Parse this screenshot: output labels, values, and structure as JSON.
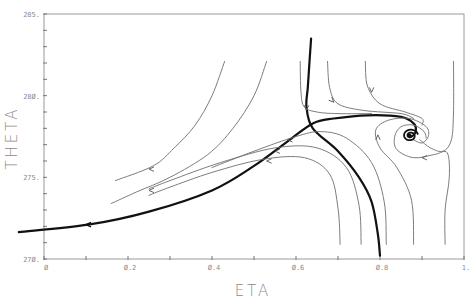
{
  "chart_data": {
    "type": "line",
    "title": "",
    "xlabel": "ETA",
    "ylabel": "THETA",
    "xlim": [
      0,
      1
    ],
    "ylim": [
      270,
      285
    ],
    "grid": false,
    "legend": null,
    "x_ticks": {
      "values": [
        0,
        0.2,
        0.4,
        0.6,
        0.8,
        1.0
      ],
      "labels": [
        "Ø",
        "Ø.2",
        "Ø.4",
        "Ø.6",
        "Ø.8",
        "1."
      ]
    },
    "y_ticks": {
      "values": [
        270,
        275,
        280,
        285
      ],
      "labels": [
        "27Ø.",
        "275.",
        "28Ø.",
        "285."
      ]
    },
    "minor_tick_step": {
      "x": 0.1,
      "y": 1
    },
    "annotations": [
      "phase-portrait trajectories with direction arrows",
      "saddle point near ETA≈0.64, THETA≈278.3",
      "stable spiral focus near ETA≈0.87, THETA≈277.5"
    ],
    "series": [
      {
        "name": "separatrix-stable-left",
        "style": "thick",
        "x": [
          -0.06,
          0.105,
          0.25,
          0.4,
          0.5,
          0.585,
          0.64,
          0.69,
          0.77,
          0.85,
          0.88,
          0.885,
          0.875,
          0.868,
          0.872
        ],
        "y": [
          271.65,
          272.1,
          272.9,
          274.2,
          275.7,
          277.3,
          278.3,
          278.6,
          278.8,
          278.7,
          278.3,
          277.8,
          277.5,
          277.6,
          277.6
        ],
        "arrows": [
          {
            "x": 0.1,
            "y": 272.1,
            "dir": "left"
          }
        ]
      },
      {
        "name": "separatrix-vertical",
        "style": "thick",
        "x": [
          0.636,
          0.632,
          0.628,
          0.625,
          0.64,
          0.7,
          0.75,
          0.78,
          0.795,
          0.8
        ],
        "y": [
          283.5,
          282,
          280.5,
          279.3,
          278.0,
          276.6,
          275.0,
          273.5,
          271.5,
          270.2
        ]
      },
      {
        "name": "traj-upper-left-1",
        "style": "thin",
        "x": [
          0.43,
          0.4,
          0.36,
          0.31,
          0.26,
          0.17
        ],
        "y": [
          282.1,
          280.0,
          278.2,
          276.8,
          275.7,
          274.8
        ],
        "arrows": [
          {
            "x": 0.25,
            "y": 275.5,
            "dir": "left"
          }
        ]
      },
      {
        "name": "traj-upper-left-2",
        "style": "thin",
        "x": [
          0.53,
          0.5,
          0.45,
          0.39,
          0.3,
          0.22,
          0.16
        ],
        "y": [
          282.1,
          280.0,
          278.0,
          276.4,
          275.0,
          274.1,
          273.4
        ],
        "arrows": [
          {
            "x": 0.25,
            "y": 274.2,
            "dir": "left"
          }
        ]
      },
      {
        "name": "traj-near-saddle-1",
        "style": "thin",
        "x": [
          0.61,
          0.612,
          0.62,
          0.65,
          0.7,
          0.78
        ],
        "y": [
          282.1,
          280.2,
          279.3,
          279.0,
          278.9,
          278.9
        ],
        "arrows": [
          {
            "x": 0.625,
            "y": 279.1,
            "dir": "down"
          }
        ]
      },
      {
        "name": "traj-near-saddle-2",
        "style": "thin",
        "x": [
          0.675,
          0.68,
          0.7,
          0.76,
          0.85,
          0.88
        ],
        "y": [
          282.1,
          280.5,
          279.5,
          279.1,
          278.9,
          278.6
        ],
        "arrows": [
          {
            "x": 0.69,
            "y": 279.6,
            "dir": "down-right"
          }
        ]
      },
      {
        "name": "traj-near-saddle-3",
        "style": "thin",
        "x": [
          0.765,
          0.77,
          0.8,
          0.86,
          0.9,
          0.9
        ],
        "y": [
          282.1,
          280.6,
          279.5,
          279.0,
          278.6,
          278.2
        ],
        "arrows": [
          {
            "x": 0.78,
            "y": 280.2,
            "dir": "down"
          }
        ]
      },
      {
        "name": "traj-lower-1",
        "style": "thin",
        "x": [
          0.705,
          0.7,
          0.68,
          0.62,
          0.52,
          0.4,
          0.3,
          0.25
        ],
        "y": [
          270.9,
          273.1,
          275.2,
          276.2,
          276.1,
          275.3,
          274.4,
          273.9
        ],
        "arrows": [
          {
            "x": 0.53,
            "y": 276.0,
            "dir": "left"
          }
        ]
      },
      {
        "name": "traj-lower-2",
        "style": "thin",
        "x": [
          0.755,
          0.75,
          0.72,
          0.65,
          0.55,
          0.42,
          0.3,
          0.25
        ],
        "y": [
          270.9,
          273.3,
          275.6,
          276.8,
          276.8,
          275.9,
          274.8,
          274.3
        ],
        "arrows": [
          {
            "x": 0.55,
            "y": 276.6,
            "dir": "left"
          }
        ]
      },
      {
        "name": "traj-lower-3",
        "style": "thin",
        "x": [
          0.815,
          0.81,
          0.78,
          0.72,
          0.66,
          0.6,
          0.5,
          0.4
        ],
        "y": [
          270.9,
          273.5,
          275.9,
          277.4,
          277.8,
          277.5,
          276.6,
          275.6
        ],
        "arrows": [
          {
            "x": 0.58,
            "y": 277.3,
            "dir": "left"
          }
        ]
      },
      {
        "name": "traj-lower-spiral-4",
        "style": "thin",
        "x": [
          0.88,
          0.875,
          0.84,
          0.8,
          0.79,
          0.82,
          0.87,
          0.91,
          0.915,
          0.9,
          0.88
        ],
        "y": [
          270.9,
          273.6,
          275.6,
          276.8,
          277.9,
          278.5,
          278.6,
          278.1,
          277.5,
          277.1,
          277.3
        ],
        "arrows": [
          {
            "x": 0.795,
            "y": 277.6,
            "dir": "up"
          }
        ]
      },
      {
        "name": "traj-right-spiral",
        "style": "thin",
        "x": [
          0.955,
          0.955,
          0.965,
          0.96,
          0.93,
          0.88,
          0.84,
          0.835,
          0.85,
          0.88,
          0.905,
          0.91
        ],
        "y": [
          270.9,
          273.0,
          275.0,
          276.5,
          276.4,
          276.2,
          276.7,
          277.5,
          278.1,
          278.2,
          277.8,
          277.4
        ],
        "arrows": [
          {
            "x": 0.9,
            "y": 276.2,
            "dir": "left"
          }
        ]
      },
      {
        "name": "traj-top-right",
        "style": "thin",
        "x": [
          0.975,
          0.975,
          0.97,
          0.95,
          0.92,
          0.895
        ],
        "y": [
          282.1,
          279.0,
          277.3,
          276.6,
          276.8,
          277.3
        ]
      }
    ]
  },
  "axes": {
    "x_label": "ETA",
    "y_label": "THETA"
  }
}
